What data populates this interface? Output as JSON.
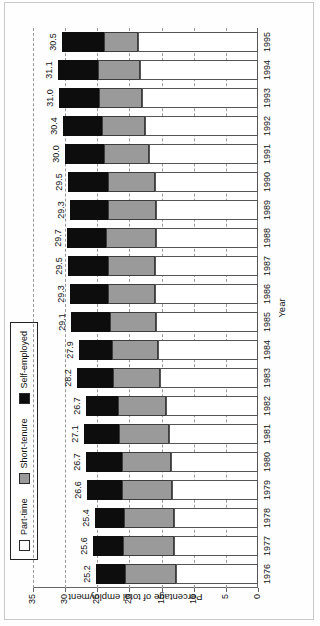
{
  "chart_data": {
    "type": "bar",
    "subtype": "stacked-horizontal",
    "title": "",
    "xlabel": "Year",
    "ylabel": "Percentage of total employment",
    "ylim": [
      0,
      35
    ],
    "yticks": [
      0,
      5,
      10,
      15,
      20,
      25,
      30,
      35
    ],
    "ytick_labels": [
      "0",
      "5",
      "10",
      "15",
      "20",
      "25",
      "30",
      "35"
    ],
    "grid": true,
    "grid_style": "dashed",
    "legend_position": "top-left",
    "orientation": "rotated-90",
    "categories": [
      "1976",
      "1977",
      "1978",
      "1979",
      "1980",
      "1981",
      "1982",
      "1983",
      "1984",
      "1985",
      "1986",
      "1987",
      "1988",
      "1989",
      "1990",
      "1991",
      "1992",
      "1993",
      "1994",
      "1995"
    ],
    "series": [
      {
        "name": "Part-time",
        "color": "#ffffff",
        "values": [
          12.8,
          13.0,
          13.1,
          13.4,
          13.5,
          13.9,
          14.3,
          15.3,
          15.6,
          15.9,
          16.1,
          16.0,
          15.8,
          15.8,
          16.1,
          17.0,
          17.6,
          18.1,
          18.3,
          18.6
        ]
      },
      {
        "name": "Short-tenure",
        "color": "#9a9a9a",
        "values": [
          7.9,
          8.0,
          7.7,
          7.7,
          7.7,
          7.8,
          7.5,
          7.3,
          7.1,
          7.2,
          7.2,
          7.4,
          7.8,
          7.5,
          7.3,
          6.9,
          6.7,
          6.7,
          6.6,
          5.3
        ]
      },
      {
        "name": "Self-employed",
        "color": "#0d0d0d",
        "values": [
          4.5,
          4.6,
          4.6,
          5.5,
          5.5,
          5.4,
          4.9,
          5.6,
          5.2,
          6.0,
          6.0,
          6.1,
          6.1,
          6.0,
          6.1,
          6.1,
          6.1,
          6.2,
          6.2,
          6.6
        ]
      }
    ],
    "totals": [
      25.2,
      25.6,
      25.4,
      26.6,
      26.7,
      27.1,
      26.7,
      28.2,
      27.9,
      29.1,
      29.3,
      29.5,
      29.7,
      29.3,
      29.5,
      30.0,
      30.4,
      31.0,
      31.1,
      30.5
    ],
    "total_labels": [
      "25.2",
      "25.6",
      "25.4",
      "26.6",
      "26.7",
      "27.1",
      "26.7",
      "28.2",
      "27.9",
      "29.1",
      "29.3",
      "29.5",
      "29.7",
      "29.3",
      "29.5",
      "30.0",
      "30.4",
      "31.0",
      "31.1",
      "30.5"
    ]
  },
  "legend": {
    "items": [
      {
        "label": "Part-time",
        "swatch": "part"
      },
      {
        "label": "Short-tenure",
        "swatch": "short"
      },
      {
        "label": "Self-employed",
        "swatch": "self"
      }
    ]
  },
  "axes": {
    "x_title": "Year",
    "y_title": "Percentage of total employment"
  }
}
